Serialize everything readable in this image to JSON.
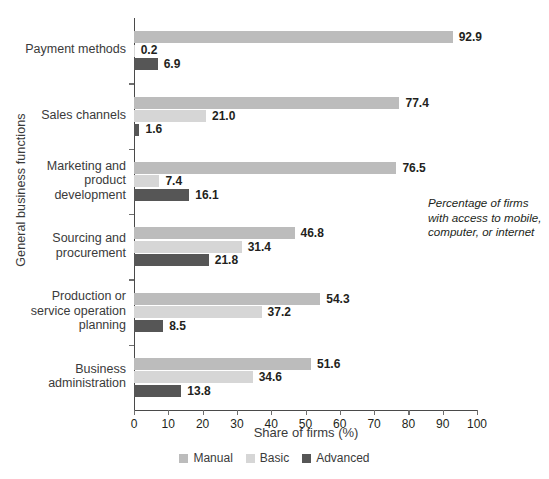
{
  "chart_data": {
    "type": "bar",
    "orientation": "horizontal",
    "title": "",
    "xlabel": "Share of firms (%)",
    "ylabel": "General business functions",
    "xlim": [
      0,
      100
    ],
    "xticks": [
      "0",
      "10",
      "20",
      "30",
      "40",
      "50",
      "60",
      "70",
      "80",
      "90",
      "100"
    ],
    "grid": false,
    "legend_position": "bottom",
    "categories": [
      "Payment methods",
      "Sales channels",
      "Marketing and product development",
      "Sourcing and procurement",
      "Production or service operation planning",
      "Business administration"
    ],
    "category_lines": [
      [
        "Payment methods"
      ],
      [
        "Sales channels"
      ],
      [
        "Marketing and",
        "product",
        "development"
      ],
      [
        "Sourcing and",
        "procurement"
      ],
      [
        "Production or",
        "service operation",
        "planning"
      ],
      [
        "Business",
        "administration"
      ]
    ],
    "series": [
      {
        "name": "Manual",
        "color": "#bcbcbc",
        "values": [
          92.9,
          77.4,
          76.5,
          46.8,
          54.3,
          51.6
        ],
        "labels": [
          "92.9",
          "77.4",
          "76.5",
          "46.8",
          "54.3",
          "51.6"
        ]
      },
      {
        "name": "Basic",
        "color": "#d6d6d6",
        "values": [
          0.2,
          21.0,
          7.4,
          31.4,
          37.2,
          34.6
        ],
        "labels": [
          "0.2",
          "21.0",
          "7.4",
          "31.4",
          "37.2",
          "34.6"
        ]
      },
      {
        "name": "Advanced",
        "color": "#565656",
        "values": [
          6.9,
          1.6,
          16.1,
          21.8,
          8.5,
          13.8
        ],
        "labels": [
          "6.9",
          "1.6",
          "16.1",
          "21.8",
          "8.5",
          "13.8"
        ]
      }
    ],
    "reference_line": {
      "value": 85,
      "style": "dashed",
      "color": "#9a9a9a"
    },
    "annotation": {
      "lines": [
        "Percentage of firms",
        "with access to mobile,",
        "computer, or internet"
      ]
    }
  }
}
